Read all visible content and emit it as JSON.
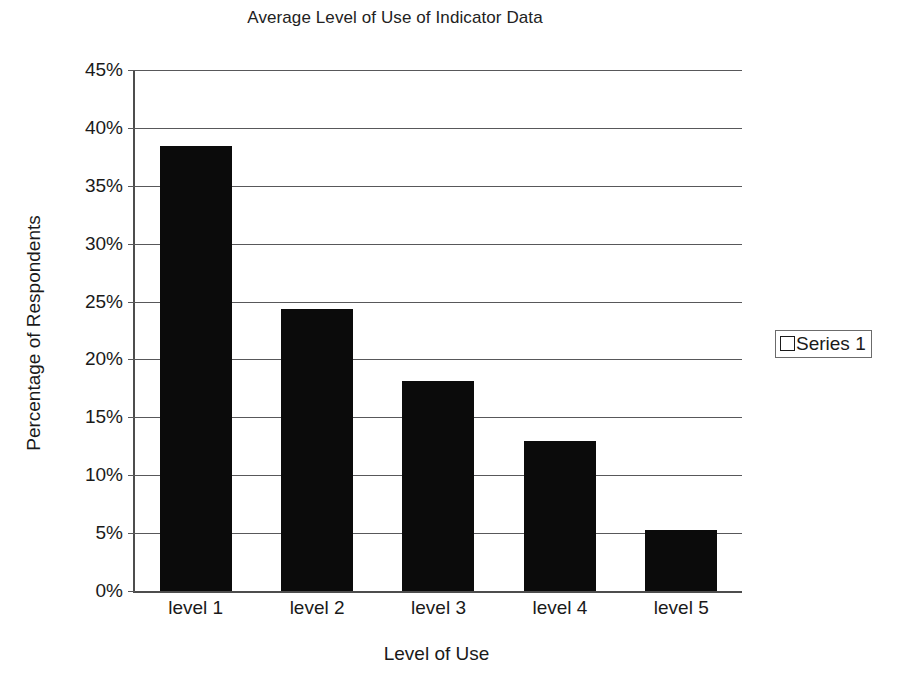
{
  "chart_data": {
    "type": "bar",
    "title": "Average Level of Use of Indicator Data",
    "xlabel": "Level of Use",
    "ylabel": "Percentage of Respondents",
    "categories": [
      "level 1",
      "level 2",
      "level 3",
      "level 4",
      "level 5"
    ],
    "values": [
      38.4,
      24.4,
      18.1,
      13.0,
      5.3
    ],
    "series": [
      {
        "name": "Series 1",
        "values": [
          38.4,
          24.4,
          18.1,
          13.0,
          5.3
        ]
      }
    ],
    "ylim": [
      0,
      45
    ],
    "ytick_labels": [
      "45%",
      "40%",
      "35%",
      "30%",
      "25%",
      "20%",
      "15%",
      "10%",
      "5%",
      "0%"
    ],
    "ytick_values": [
      45,
      40,
      35,
      30,
      25,
      20,
      15,
      10,
      5,
      0
    ],
    "ytick_step": 5,
    "grid": true,
    "grid_axis": "y",
    "legend": {
      "position": "right",
      "entries": [
        {
          "label": "Series 1",
          "marker": "legend-swatch-icon",
          "color": "#ffffff",
          "border_color": "#1a1a1a"
        }
      ]
    },
    "bar_color": "#0b0b0b",
    "plot_background": "#ffffff",
    "axis_color": "#4d4d4d"
  }
}
